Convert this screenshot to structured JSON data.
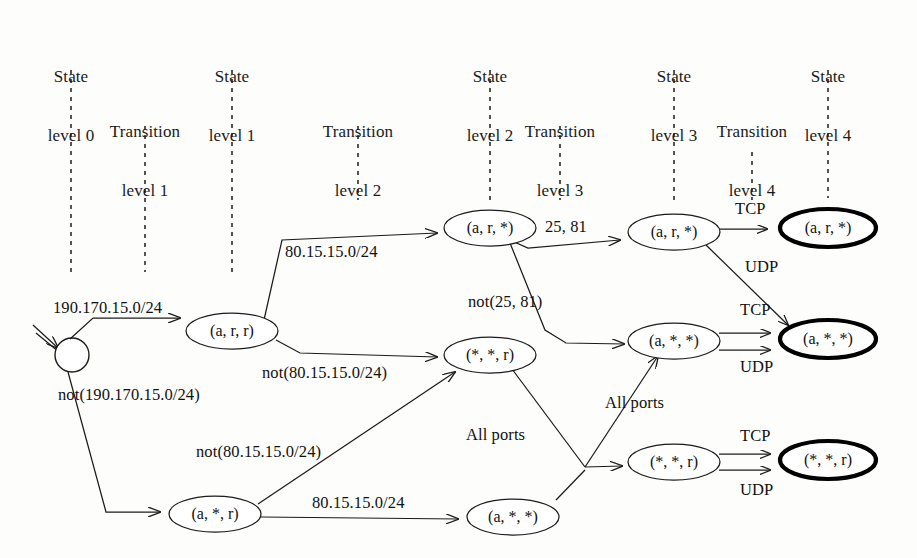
{
  "figure": {
    "kind": "state-transition-tree",
    "background": "#fdfdfb",
    "ink": "#1b1b1b"
  },
  "column_headers": [
    {
      "id": "state-level-0",
      "line1": "State",
      "line2": "level 0",
      "x": 71,
      "y": 28
    },
    {
      "id": "transition-level-1",
      "line1": "Transition",
      "line2": "level 1",
      "x": 145,
      "y": 83
    },
    {
      "id": "state-level-1",
      "line1": "State",
      "line2": "level 1",
      "x": 232,
      "y": 28
    },
    {
      "id": "transition-level-2",
      "line1": "Transition",
      "line2": "level 2",
      "x": 358,
      "y": 83
    },
    {
      "id": "state-level-2",
      "line1": "State",
      "line2": "level 2",
      "x": 490,
      "y": 28
    },
    {
      "id": "transition-level-3",
      "line1": "Transition",
      "line2": "level 3",
      "x": 560,
      "y": 83
    },
    {
      "id": "state-level-3",
      "line1": "State",
      "line2": "level 3",
      "x": 674,
      "y": 28
    },
    {
      "id": "transition-level-4",
      "line1": "Transition",
      "line2": "level 4",
      "x": 752,
      "y": 83
    },
    {
      "id": "state-level-4",
      "line1": "State",
      "line2": "level 4",
      "x": 828,
      "y": 28
    }
  ],
  "guide_lines": [
    {
      "id": "guide-state-0",
      "x": 71,
      "y1": 70,
      "y2": 272
    },
    {
      "id": "guide-transition-1",
      "x": 145,
      "y1": 126,
      "y2": 272
    },
    {
      "id": "guide-state-1",
      "x": 232,
      "y1": 70,
      "y2": 272
    },
    {
      "id": "guide-transition-2",
      "x": 358,
      "y1": 126,
      "y2": 200
    },
    {
      "id": "guide-state-2",
      "x": 490,
      "y1": 70,
      "y2": 200
    },
    {
      "id": "guide-transition-3",
      "x": 560,
      "y1": 126,
      "y2": 200
    },
    {
      "id": "guide-state-3",
      "x": 674,
      "y1": 70,
      "y2": 200
    },
    {
      "id": "guide-transition-4",
      "x": 752,
      "y1": 150,
      "y2": 200
    },
    {
      "id": "guide-state-4",
      "x": 828,
      "y1": 70,
      "y2": 200
    }
  ],
  "start_state": {
    "id": "start-state",
    "cx": 72,
    "cy": 355,
    "r": 17,
    "label": ""
  },
  "nodes": [
    {
      "id": "n-l1-arr",
      "label": "(a, r, r)",
      "cx": 232,
      "cy": 331,
      "rx": 46,
      "ry": 18,
      "final": false
    },
    {
      "id": "n-l1-asr",
      "label": "(a, *, r)",
      "cx": 215,
      "cy": 514,
      "rx": 46,
      "ry": 18,
      "final": false
    },
    {
      "id": "n-l2-ars",
      "label": "(a, r, *)",
      "cx": 490,
      "cy": 228,
      "rx": 46,
      "ry": 18,
      "final": false
    },
    {
      "id": "n-l2-ssr",
      "label": "(*, *, r)",
      "cx": 490,
      "cy": 355,
      "rx": 46,
      "ry": 18,
      "final": false
    },
    {
      "id": "n-l2-ass",
      "label": "(a, *, *)",
      "cx": 513,
      "cy": 517,
      "rx": 46,
      "ry": 18,
      "final": false
    },
    {
      "id": "n-l3-ars",
      "label": "(a, r, *)",
      "cx": 674,
      "cy": 232,
      "rx": 46,
      "ry": 18,
      "final": false
    },
    {
      "id": "n-l3-ass",
      "label": "(a, *, *)",
      "cx": 674,
      "cy": 341,
      "rx": 46,
      "ry": 18,
      "final": false
    },
    {
      "id": "n-l3-ssr",
      "label": "(*, *, r)",
      "cx": 674,
      "cy": 462,
      "rx": 46,
      "ry": 18,
      "final": false
    },
    {
      "id": "n-l4-ars",
      "label": "(a, r, *)",
      "cx": 828,
      "cy": 228,
      "rx": 48,
      "ry": 19,
      "final": true
    },
    {
      "id": "n-l4-ass",
      "label": "(a, *, *)",
      "cx": 828,
      "cy": 339,
      "rx": 48,
      "ry": 19,
      "final": true
    },
    {
      "id": "n-l4-ssr",
      "label": "(*, *, r)",
      "cx": 828,
      "cy": 460,
      "rx": 48,
      "ry": 19,
      "final": true
    }
  ],
  "edge_labels": [
    {
      "id": "lbl-190-170",
      "text": "190.170.15.0/24",
      "x": 53,
      "y": 313,
      "anchor": "start"
    },
    {
      "id": "lbl-not-190-170",
      "text": "not(190.170.15.0/24)",
      "x": 58,
      "y": 400,
      "anchor": "start"
    },
    {
      "id": "lbl-80-15-top",
      "text": "80.15.15.0/24",
      "x": 285,
      "y": 257,
      "anchor": "start"
    },
    {
      "id": "lbl-not-80-15-a",
      "text": "not(80.15.15.0/24)",
      "x": 262,
      "y": 378,
      "anchor": "start"
    },
    {
      "id": "lbl-not-80-15-b",
      "text": "not(80.15.15.0/24)",
      "x": 196,
      "y": 457,
      "anchor": "start"
    },
    {
      "id": "lbl-80-15-bot",
      "text": "80.15.15.0/24",
      "x": 312,
      "y": 508,
      "anchor": "start"
    },
    {
      "id": "lbl-25-81",
      "text": "25, 81",
      "x": 545,
      "y": 232,
      "anchor": "start"
    },
    {
      "id": "lbl-not-25-81",
      "text": "not(25, 81)",
      "x": 468,
      "y": 307,
      "anchor": "start"
    },
    {
      "id": "lbl-allports-1",
      "text": "All ports",
      "x": 466,
      "y": 440,
      "anchor": "start"
    },
    {
      "id": "lbl-allports-2",
      "text": "All ports",
      "x": 605,
      "y": 408,
      "anchor": "start"
    },
    {
      "id": "lbl-tcp-1",
      "text": "TCP",
      "x": 735,
      "y": 214,
      "anchor": "start"
    },
    {
      "id": "lbl-udp-1",
      "text": "UDP",
      "x": 745,
      "y": 272,
      "anchor": "start"
    },
    {
      "id": "lbl-tcp-2",
      "text": "TCP",
      "x": 740,
      "y": 315,
      "anchor": "start"
    },
    {
      "id": "lbl-udp-2",
      "text": "UDP",
      "x": 740,
      "y": 372,
      "anchor": "start"
    },
    {
      "id": "lbl-tcp-3",
      "text": "TCP",
      "x": 740,
      "y": 441,
      "anchor": "start"
    },
    {
      "id": "lbl-udp-3",
      "text": "UDP",
      "x": 740,
      "y": 495,
      "anchor": "start"
    }
  ],
  "transitions": [
    {
      "id": "t-start-to-arr",
      "from": "start-state",
      "to": "n-l1-arr",
      "label": "190.170.15.0/24"
    },
    {
      "id": "t-start-to-asr",
      "from": "start-state",
      "to": "n-l1-asr",
      "label": "not(190.170.15.0/24)"
    },
    {
      "id": "t-arr-to-ars",
      "from": "n-l1-arr",
      "to": "n-l2-ars",
      "label": "80.15.15.0/24"
    },
    {
      "id": "t-arr-to-ssr",
      "from": "n-l1-arr",
      "to": "n-l2-ssr",
      "label": "not(80.15.15.0/24)"
    },
    {
      "id": "t-asr-to-ssr",
      "from": "n-l1-asr",
      "to": "n-l2-ssr",
      "label": "not(80.15.15.0/24)"
    },
    {
      "id": "t-asr-to-ass",
      "from": "n-l1-asr",
      "to": "n-l2-ass",
      "label": "80.15.15.0/24"
    },
    {
      "id": "t-l2ars-to-l3ars",
      "from": "n-l2-ars",
      "to": "n-l3-ars",
      "label": "25, 81"
    },
    {
      "id": "t-l2ars-to-l3ass",
      "from": "n-l2-ars",
      "to": "n-l3-ass",
      "label": "not(25, 81)"
    },
    {
      "id": "t-l2ssr-to-l3ass",
      "from": "n-l2-ssr",
      "to": "n-l3-ass",
      "label": "All ports"
    },
    {
      "id": "t-l2ssr-to-l3ssr",
      "from": "n-l2-ssr",
      "to": "n-l3-ssr",
      "label": "All ports"
    },
    {
      "id": "t-l3ars-to-l4ars-tcp",
      "from": "n-l3-ars",
      "to": "n-l4-ars",
      "label": "TCP"
    },
    {
      "id": "t-l3ars-to-l4ass-udp",
      "from": "n-l3-ars",
      "to": "n-l4-ass",
      "label": "UDP"
    },
    {
      "id": "t-l3ass-to-l4ass-tcp",
      "from": "n-l3-ass",
      "to": "n-l4-ass",
      "label": "TCP"
    },
    {
      "id": "t-l3ass-to-l4ass-udp",
      "from": "n-l3-ass",
      "to": "n-l4-ass",
      "label": "UDP"
    },
    {
      "id": "t-l3ssr-to-l4ssr-tcp",
      "from": "n-l3-ssr",
      "to": "n-l4-ssr",
      "label": "TCP"
    },
    {
      "id": "t-l3ssr-to-l4ssr-udp",
      "from": "n-l3-ssr",
      "to": "n-l4-ssr",
      "label": "UDP"
    }
  ]
}
